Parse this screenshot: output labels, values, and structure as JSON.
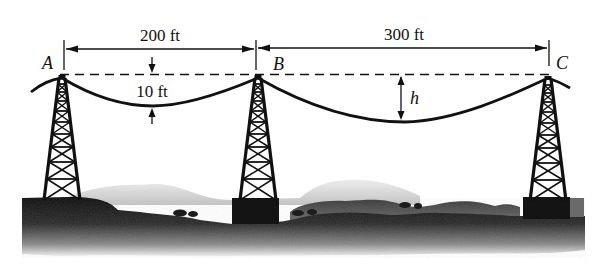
{
  "figure": {
    "type": "power-line-sag-diagram",
    "colors": {
      "ink": "#111111",
      "ground_dark": "#151515",
      "hill_light": "#d9d9d9",
      "background": "#ffffff"
    }
  },
  "points": {
    "a": {
      "label": "A"
    },
    "b": {
      "label": "B"
    },
    "c": {
      "label": "C"
    }
  },
  "dimensions": {
    "span_ab": {
      "label": "200 ft"
    },
    "span_bc": {
      "label": "300 ft"
    },
    "sag_ab": {
      "label": "10 ft"
    },
    "sag_bc": {
      "label": "h"
    }
  },
  "towers": [
    {
      "name": "tower-a"
    },
    {
      "name": "tower-b"
    },
    {
      "name": "tower-c"
    }
  ]
}
